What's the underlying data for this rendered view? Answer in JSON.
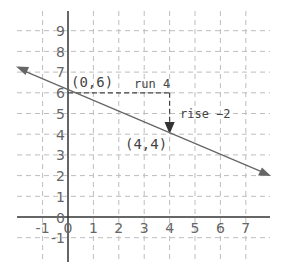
{
  "diagram": {
    "type": "coordinate-plane-line",
    "x_ticks": [
      "-1",
      "0",
      "1",
      "2",
      "3",
      "4",
      "5",
      "6",
      "7"
    ],
    "y_ticks": [
      "-1",
      "0",
      "1",
      "2",
      "3",
      "4",
      "5",
      "6",
      "7",
      "8",
      "9"
    ],
    "line": {
      "through": [
        [
          0,
          6
        ],
        [
          4,
          4
        ]
      ],
      "slope": -0.5,
      "color": "#666666"
    },
    "labels": {
      "point_a": "(0,6)",
      "point_b": "(4,4)",
      "run": "run 4",
      "rise": "rise −2"
    },
    "colors": {
      "axis": "#333333",
      "grid": "#bbbbbb",
      "line": "#666666"
    }
  }
}
